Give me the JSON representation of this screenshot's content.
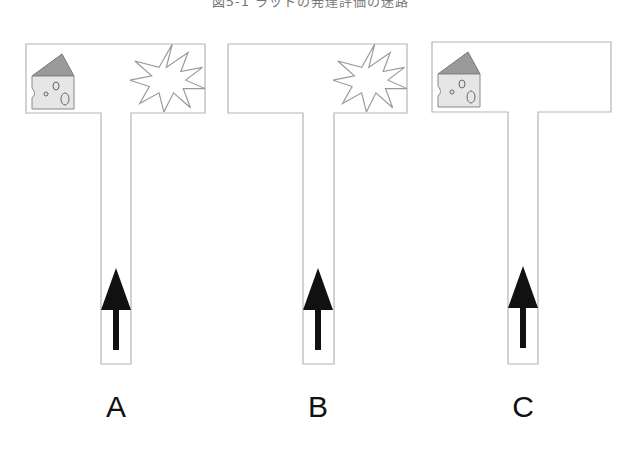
{
  "caption": "図5-1 ラットの発達評価の迷路",
  "mazes": [
    {
      "label": "A",
      "left_item": "cheese",
      "right_item": "shock-burst",
      "start_arrow": "up"
    },
    {
      "label": "B",
      "left_item": "none",
      "right_item": "shock-burst",
      "start_arrow": "up"
    },
    {
      "label": "C",
      "left_item": "cheese",
      "right_item": "none",
      "start_arrow": "up"
    }
  ],
  "colors": {
    "wall": "#b5b5b5",
    "cheese_body": "#e6e6e6",
    "cheese_rind": "#9a9a9a",
    "arrow": "#111111"
  }
}
